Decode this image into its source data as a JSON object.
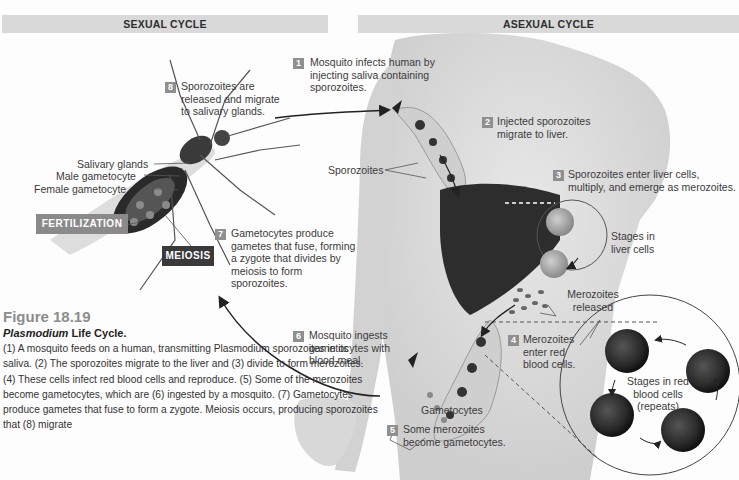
{
  "headers": {
    "sexual_cycle": "SEXUAL CYCLE",
    "asexual_cycle": "ASEXUAL CYCLE"
  },
  "steps": [
    {
      "num": "1",
      "text": "Mosquito infects human by injecting saliva containing sporozoites."
    },
    {
      "num": "2",
      "text": "Injected sporozoites migrate to liver."
    },
    {
      "num": "3",
      "text": "Sporozoites enter liver cells, multiply, and emerge as merozoites."
    },
    {
      "num": "4",
      "text": "Merozoites enter red blood cells."
    },
    {
      "num": "5",
      "text": "Some merozoites become gametocytes."
    },
    {
      "num": "6",
      "text": "Mosquito ingests gametocytes with blood meal."
    },
    {
      "num": "7",
      "text": "Gametocytes produce gametes that fuse, forming a zygote that divides by meiosis to form sporozoites."
    },
    {
      "num": "8",
      "text": "Sporozoites are released and migrate to salivary glands."
    }
  ],
  "labels": {
    "salivary_glands": "Salivary glands",
    "male_gametocyte": "Male gametocyte",
    "female_gametocyte": "Female gametocyte",
    "sporozoites": "Sporozoites",
    "stages_liver": "Stages in liver cells",
    "merozoites_released": "Merozoites released",
    "gametocytes": "Gametocytes",
    "stages_rbc": "Stages in red blood cells (repeats)"
  },
  "tags": {
    "fertilization": "FERTILIZATION",
    "meiosis": "MEIOSIS"
  },
  "caption": {
    "figure_number": "Figure 18.19",
    "title_italic": "Plasmodium",
    "title_rest": " Life Cycle.",
    "body": "(1) A mosquito feeds on a human, transmitting Plasmodium sporozoites in its saliva. (2) The sporozoites migrate to the liver and (3) divide to form merozoites. (4) These cells infect red blood cells and reproduce. (5) Some of the merozoites become gametocytes, which are (6) ingested by a mosquito. (7) Gametocytes produce gametes that fuse to form a zygote. Meiosis occurs, producing sporozoites that (8) migrate"
  },
  "colors": {
    "badge": "#8f8f8f",
    "header_bar": "#d9d9d9",
    "fertilization_tag": "#8a8a8a",
    "meiosis_tag": "#3a3a3a",
    "figure_number": "#8c8c8c"
  }
}
